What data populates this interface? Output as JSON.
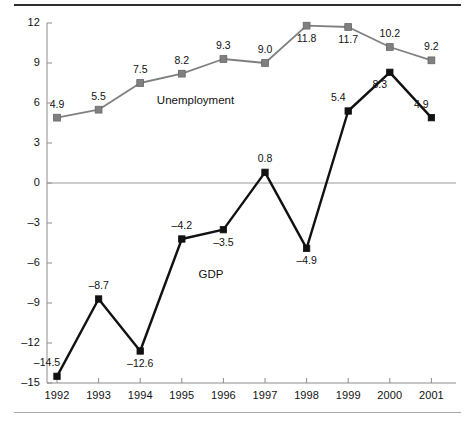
{
  "figure": {
    "top_rule_color": "#2e2e2e",
    "bottom_rule_color": "#a9a9a9",
    "background": "#ffffff"
  },
  "chart_data": {
    "type": "line",
    "title": "",
    "subtitle": "",
    "xlabel": "",
    "ylabel": "",
    "categories": [
      "1992",
      "1993",
      "1994",
      "1995",
      "1996",
      "1997",
      "1998",
      "1999",
      "2000",
      "2001"
    ],
    "x": [
      1992,
      1993,
      1994,
      1995,
      1996,
      1997,
      1998,
      1999,
      2000,
      2001
    ],
    "ylim": [
      -15,
      12
    ],
    "yticks": [
      12,
      9,
      6,
      3,
      0,
      -3,
      -6,
      -9,
      -12,
      -15
    ],
    "ytick_labels": [
      "12",
      "9",
      "6",
      "3",
      "0",
      "–3",
      "–6",
      "–9",
      "–12",
      "–15"
    ],
    "grid": false,
    "zero_line": true,
    "legend": "inline-annotations",
    "series": [
      {
        "name": "Unemployment",
        "color": "#808080",
        "marker": "square",
        "values": [
          4.9,
          5.5,
          7.5,
          8.2,
          9.3,
          9.0,
          11.8,
          11.7,
          10.2,
          9.2
        ],
        "labels": [
          "4.9",
          "5.5",
          "7.5",
          "8.2",
          "9.3",
          "9.0",
          "11.8",
          "11.7",
          "10.2",
          "9.2"
        ],
        "label_positions": [
          "above",
          "above",
          "above",
          "above",
          "above",
          "above",
          "below",
          "below",
          "above",
          "above"
        ]
      },
      {
        "name": "GDP",
        "color": "#111111",
        "marker": "square",
        "values": [
          -14.5,
          -8.7,
          -12.6,
          -4.2,
          -3.5,
          0.8,
          -4.9,
          5.4,
          8.3,
          4.9
        ],
        "labels": [
          "–14.5",
          "–8.7",
          "–12.6",
          "–4.2",
          "–3.5",
          "0.8",
          "–4.9",
          "5.4",
          "8.3",
          "4.9"
        ],
        "label_positions": [
          "above-left",
          "above",
          "below",
          "above",
          "below",
          "above",
          "below",
          "above-left",
          "below-left",
          "above-left"
        ]
      }
    ],
    "annotations": [
      {
        "text": "Unemployment",
        "x": 1994.4,
        "y": 6.1
      },
      {
        "text": "GDP",
        "x": 1995.4,
        "y": -7.0
      }
    ]
  }
}
